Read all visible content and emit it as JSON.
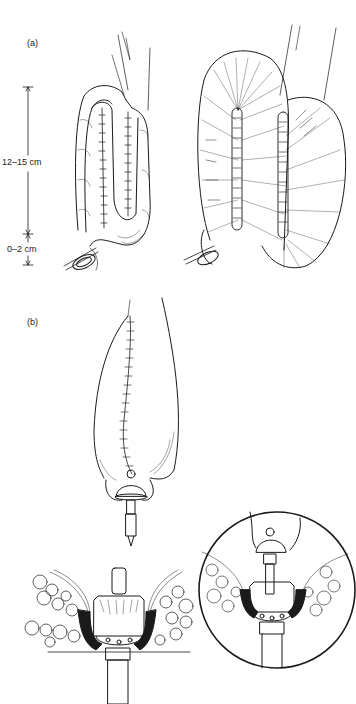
{
  "panels": {
    "a": {
      "label": "(a)",
      "measurements": [
        {
          "label": "12–15 cm"
        },
        {
          "label": "0–2 cm"
        }
      ],
      "figures": [
        "j-pouch-exterior",
        "j-pouch-opened"
      ]
    },
    "b": {
      "label": "(b)",
      "figures": [
        "pouch-with-anvil",
        "stapled-anastomosis",
        "anastomosis-inset-circle"
      ]
    }
  },
  "colors": {
    "ink": "#1a1a1a",
    "background": "#ffffff"
  }
}
